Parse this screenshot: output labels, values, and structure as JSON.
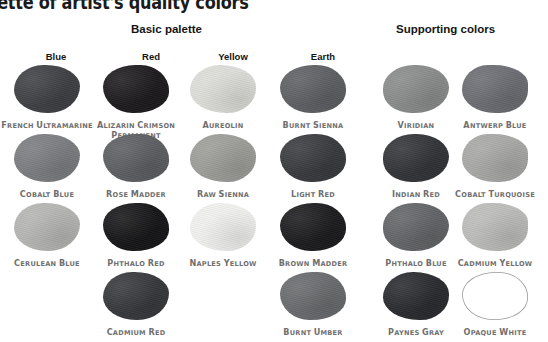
{
  "title": "palette of artist's quality colors",
  "groups": {
    "basic": "Basic palette",
    "supporting": "Supporting colors"
  },
  "columns": [
    {
      "label": "Blue",
      "x": 23
    },
    {
      "label": "Red",
      "x": 118
    },
    {
      "label": "Yellow",
      "x": 200
    },
    {
      "label": "Earth",
      "x": 290
    }
  ],
  "swatches": [
    {
      "name": "French Ultramarine",
      "color": "#3f4145",
      "col": 0,
      "row": 0
    },
    {
      "name": "Alizarin Crimson Permanent",
      "color": "#1e1c1e",
      "col": 1,
      "row": 0
    },
    {
      "name": "Aureolin",
      "color": "#dcdcd8",
      "col": 2,
      "row": 0
    },
    {
      "name": "Burnt Sienna",
      "color": "#5e6064",
      "col": 3,
      "row": 0
    },
    {
      "name": "Viridian",
      "color": "#8a8c8c",
      "col": 4,
      "row": 0
    },
    {
      "name": "Antwerp Blue",
      "color": "#6c6e73",
      "col": 5,
      "row": 0
    },
    {
      "name": "Cobalt Blue",
      "color": "#7b7d80",
      "col": 0,
      "row": 1
    },
    {
      "name": "Rose Madder",
      "color": "#5d5f62",
      "col": 1,
      "row": 1
    },
    {
      "name": "Raw Sienna",
      "color": "#9d9d99",
      "col": 2,
      "row": 1
    },
    {
      "name": "Light Red",
      "color": "#3a3b3f",
      "col": 3,
      "row": 1
    },
    {
      "name": "Indian Red",
      "color": "#343539",
      "col": 4,
      "row": 1
    },
    {
      "name": "Cobalt Turquoise",
      "color": "#a8a8a6",
      "col": 5,
      "row": 1
    },
    {
      "name": "Cerulean Blue",
      "color": "#b5b5b3",
      "col": 0,
      "row": 2
    },
    {
      "name": "Phthalo Red",
      "color": "#171719",
      "col": 1,
      "row": 2
    },
    {
      "name": "Naples Yellow",
      "color": "#f0f0ee",
      "col": 2,
      "row": 2
    },
    {
      "name": "Brown Madder",
      "color": "#1d1d1f",
      "col": 3,
      "row": 2
    },
    {
      "name": "Phthalo Blue",
      "color": "#646568",
      "col": 4,
      "row": 2
    },
    {
      "name": "Cadmium Yellow",
      "color": "#bcbcba",
      "col": 5,
      "row": 2
    },
    {
      "name": "Cadmium Red",
      "color": "#38393d",
      "col": 1,
      "row": 3
    },
    {
      "name": "Burnt Umber",
      "color": "#6a6b6e",
      "col": 3,
      "row": 3
    },
    {
      "name": "Paynes Gray",
      "color": "#2b2c30",
      "col": 4,
      "row": 3
    },
    {
      "name": "Opaque White",
      "color": "#ffffff",
      "col": 5,
      "row": 3,
      "outlined": true
    }
  ],
  "layout": {
    "col_x": [
      14,
      103,
      190,
      280,
      383,
      462
    ],
    "row_y": [
      65,
      134,
      203,
      272
    ],
    "outline_color": "#9a9a9a"
  }
}
